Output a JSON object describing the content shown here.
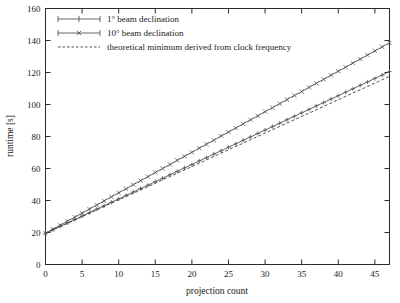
{
  "chart_data": {
    "type": "line",
    "title": "",
    "xlabel": "projection count",
    "ylabel": "runtime [s]",
    "xlim": [
      0,
      47
    ],
    "ylim": [
      0,
      160
    ],
    "xticks": [
      0,
      5,
      10,
      15,
      20,
      25,
      30,
      35,
      40,
      45
    ],
    "yticks": [
      0,
      20,
      40,
      60,
      80,
      100,
      120,
      140,
      160
    ],
    "grid": false,
    "legend_position": "top-left",
    "x": [
      0,
      1,
      2,
      3,
      4,
      5,
      6,
      7,
      8,
      9,
      10,
      11,
      12,
      13,
      14,
      15,
      16,
      17,
      18,
      19,
      20,
      21,
      22,
      23,
      24,
      25,
      26,
      27,
      28,
      29,
      30,
      31,
      32,
      33,
      34,
      35,
      36,
      37,
      38,
      39,
      40,
      41,
      42,
      43,
      44,
      45,
      46,
      47
    ],
    "series": [
      {
        "name": "1° beam declination",
        "marker": "plus",
        "style": "solid",
        "color": "#555555",
        "values": [
          19.5,
          21.7,
          23.8,
          26.0,
          28.1,
          30.3,
          32.4,
          34.6,
          36.7,
          38.9,
          41.0,
          43.2,
          45.3,
          47.5,
          49.6,
          51.8,
          53.9,
          56.1,
          58.2,
          60.4,
          62.5,
          64.7,
          66.8,
          69.0,
          71.1,
          73.3,
          75.4,
          77.6,
          79.7,
          81.9,
          84.0,
          86.2,
          88.3,
          90.5,
          92.6,
          94.8,
          96.9,
          99.1,
          101.2,
          103.4,
          105.5,
          107.7,
          109.8,
          112.0,
          114.1,
          116.3,
          118.4,
          120.6
        ]
      },
      {
        "name": "10° beam declination",
        "marker": "cross",
        "style": "solid",
        "color": "#555555",
        "values": [
          19.5,
          22.0,
          24.5,
          27.1,
          29.6,
          32.1,
          34.7,
          37.2,
          39.7,
          42.3,
          44.8,
          47.3,
          49.9,
          52.4,
          54.9,
          57.5,
          60.0,
          62.5,
          65.1,
          67.6,
          70.1,
          72.7,
          75.2,
          77.7,
          80.3,
          82.8,
          85.3,
          87.9,
          90.4,
          92.9,
          95.5,
          98.0,
          100.5,
          103.1,
          105.6,
          108.1,
          110.7,
          113.2,
          115.7,
          118.3,
          120.8,
          123.3,
          125.9,
          128.4,
          130.9,
          133.5,
          136.0,
          138.5
        ]
      },
      {
        "name": "theoretical minimum derived from clock frequency",
        "marker": "none",
        "style": "dashed",
        "color": "#3c3c3c",
        "values": [
          19.5,
          21.6,
          23.7,
          25.7,
          27.8,
          29.9,
          32.0,
          34.1,
          36.2,
          38.3,
          40.4,
          42.4,
          44.5,
          46.6,
          48.7,
          50.8,
          52.9,
          55.0,
          57.1,
          59.1,
          61.2,
          63.3,
          65.4,
          67.5,
          69.6,
          71.7,
          73.8,
          75.8,
          77.9,
          80.0,
          82.1,
          84.2,
          86.3,
          88.4,
          90.5,
          92.5,
          94.6,
          96.7,
          98.8,
          100.9,
          103.0,
          105.1,
          107.2,
          109.2,
          111.3,
          113.4,
          115.5,
          117.6
        ]
      }
    ]
  },
  "legend": {
    "entries": [
      {
        "label": "1° beam declination"
      },
      {
        "label": "10° beam declination"
      },
      {
        "label": "theoretical minimum derived from clock frequency"
      }
    ]
  },
  "axes": {
    "x_title": "projection count",
    "y_title": "runtime [s]",
    "x_tick_labels": [
      "0",
      "5",
      "10",
      "15",
      "20",
      "25",
      "30",
      "35",
      "40",
      "45"
    ],
    "y_tick_labels": [
      "0",
      "20",
      "40",
      "60",
      "80",
      "100",
      "120",
      "140",
      "160"
    ]
  }
}
